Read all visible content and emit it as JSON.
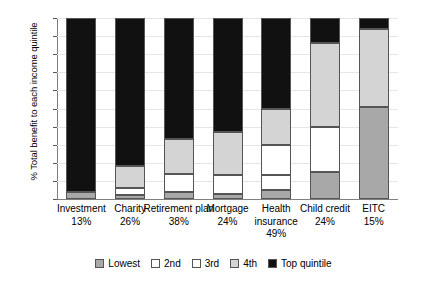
{
  "chart_data": {
    "type": "bar",
    "subtype": "stacked-100-percent",
    "title": "",
    "xlabel": "",
    "ylabel": "% Total benefit to each income quintile",
    "ylim": [
      0,
      100
    ],
    "yticks": [
      0,
      10,
      20,
      30,
      40,
      50,
      60,
      70,
      80,
      90,
      100
    ],
    "grid": true,
    "legend_position": "bottom",
    "categories": [
      "Investment",
      "Charity",
      "Retirement plan",
      "Mortgage",
      "Health insurance",
      "Child credit",
      "EITC"
    ],
    "category_sublabels": [
      "13%",
      "26%",
      "38%",
      "24%",
      "49%",
      "24%",
      "15%"
    ],
    "series": [
      {
        "name": "Lowest",
        "color": "#a8a8a8",
        "values": [
          4,
          2,
          4,
          3,
          5,
          15,
          51
        ]
      },
      {
        "name": "2nd",
        "color": "#ffffff",
        "values": [
          0,
          4,
          10,
          10,
          8,
          0,
          0
        ]
      },
      {
        "name": "3rd",
        "color": "#ffffff",
        "values": [
          0,
          0,
          0,
          0,
          17,
          25,
          0
        ]
      },
      {
        "name": "4th",
        "color": "#d4d4d4",
        "values": [
          0,
          12,
          19,
          24,
          20,
          46,
          43
        ]
      },
      {
        "name": "Top quintile",
        "color": "#111111",
        "values": [
          96,
          82,
          67,
          63,
          50,
          14,
          6
        ]
      }
    ]
  },
  "legend": {
    "items": [
      {
        "label": "Lowest",
        "swatch": "#a8a8a8"
      },
      {
        "label": "2nd",
        "swatch": "#ffffff"
      },
      {
        "label": "3rd",
        "swatch": "#ffffff"
      },
      {
        "label": "4th",
        "swatch": "#d4d4d4"
      },
      {
        "label": "Top quintile",
        "swatch": "#111111"
      }
    ]
  }
}
